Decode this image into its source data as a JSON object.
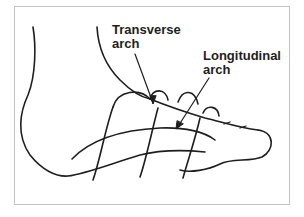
{
  "diagram": {
    "labels": {
      "transverse": {
        "line1": "Transverse",
        "line2": "arch"
      },
      "longitudinal": {
        "line1": "Longitudinal",
        "line2": "arch"
      }
    },
    "colors": {
      "stroke": "#1e1e1e",
      "frame": "#c4c4c4",
      "background": "#ffffff"
    }
  }
}
